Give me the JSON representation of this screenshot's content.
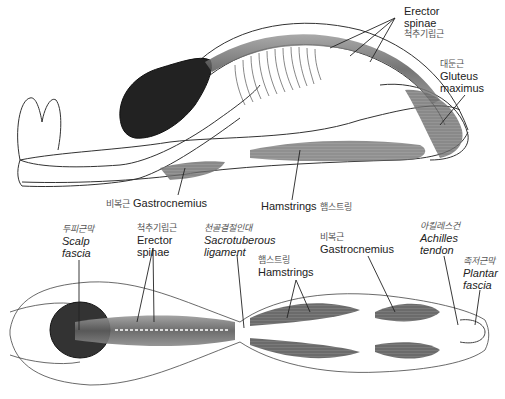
{
  "figure": {
    "top_view": {
      "labels": [
        {
          "id": "erector-spinae-top",
          "en": "Erector\nspinae",
          "en_1": "Erector",
          "en_2": "spinae",
          "ko": "척추기립근"
        },
        {
          "id": "gluteus-maximus",
          "en_1": "Gluteus",
          "en_2": "maximus",
          "ko": "대둔근"
        },
        {
          "id": "gastrocnemius-top",
          "en": "Gastrocnemius",
          "ko": "비복근"
        },
        {
          "id": "hamstrings-top",
          "en": "Hamstrings",
          "ko": "햄스트링"
        }
      ]
    },
    "bottom_view": {
      "labels": [
        {
          "id": "scalp-fascia",
          "en_1": "Scalp",
          "en_2": "fascia",
          "ko": "두피근막"
        },
        {
          "id": "erector-spinae-bottom",
          "en_1": "Erector",
          "en_2": "spinae",
          "ko": "척추기립근"
        },
        {
          "id": "sacrotuberous-ligament",
          "en_1": "Sacrotuberous",
          "en_2": "ligament",
          "ko": "천골결절인대"
        },
        {
          "id": "hamstrings-bottom",
          "en": "Hamstrings",
          "ko": "햄스트링"
        },
        {
          "id": "gastrocnemius-bottom",
          "en": "Gastrocnemius",
          "ko": "비복근"
        },
        {
          "id": "achilles-tendon",
          "en_1": "Achilles",
          "en_2": "tendon",
          "ko": "아킬레스건"
        },
        {
          "id": "plantar-fascia",
          "en_1": "Plantar",
          "en_2": "fascia",
          "ko": "족저근막"
        }
      ]
    }
  }
}
